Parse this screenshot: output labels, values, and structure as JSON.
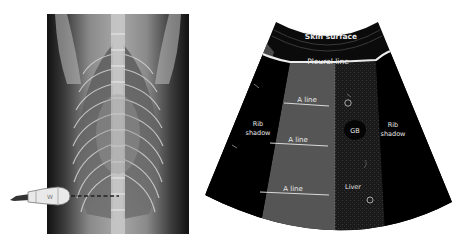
{
  "figure": {
    "left_panel": {
      "name": "Thoracic radiograph (ventrodorsal view) with ultrasound probe",
      "probe_icon": "ultrasound-probe-icon",
      "probe_mark": "W"
    },
    "right_panel": {
      "name": "Ultrasound schematic",
      "labels": {
        "skin_surface": "Skin surface",
        "pleural_line": "Pleural line",
        "a_line_1": "A line",
        "a_line_2": "A line",
        "a_line_3": "A line",
        "rib_shadow_left_1": "Rib",
        "rib_shadow_left_2": "shadow",
        "rib_shadow_right_1": "Rib",
        "rib_shadow_right_2": "shadow",
        "gb": "GB",
        "liver": "Liver"
      }
    },
    "colors": {
      "fan_dark": "#0b0b0b",
      "a_line_region": "#555555",
      "liver_region": "#1c1c1c",
      "lines": "#e6e6e6",
      "xray_bg": "#2a2a2a"
    }
  }
}
